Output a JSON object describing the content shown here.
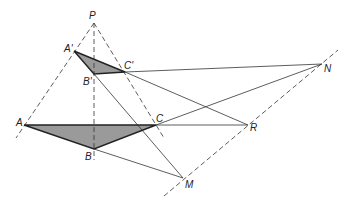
{
  "diagram": {
    "points": {
      "P": {
        "label": "P",
        "x": 94,
        "y": 23
      },
      "A1": {
        "label": "A'",
        "x": 74,
        "y": 51
      },
      "B1": {
        "label": "B'",
        "x": 94,
        "y": 74
      },
      "C1": {
        "label": "C'",
        "x": 125,
        "y": 72
      },
      "A": {
        "label": "A",
        "x": 24,
        "y": 125
      },
      "B": {
        "label": "B",
        "x": 94,
        "y": 149
      },
      "C": {
        "label": "C",
        "x": 156,
        "y": 125
      },
      "M": {
        "label": "M",
        "x": 183,
        "y": 178
      },
      "R": {
        "label": "R",
        "x": 248,
        "y": 125
      },
      "N": {
        "label": "N",
        "x": 322,
        "y": 64
      }
    },
    "triangles": [
      {
        "name": "A'B'C'",
        "vertices": [
          "A1",
          "B1",
          "C1"
        ],
        "fill": "#9a9a9a"
      },
      {
        "name": "ABC",
        "vertices": [
          "A",
          "B",
          "C"
        ],
        "fill": "#9a9a9a"
      }
    ],
    "axis_line": {
      "name": "Desargues axis",
      "through": [
        "M",
        "R",
        "N"
      ],
      "style": "dashed"
    },
    "perspective_lines": [
      {
        "from": "P",
        "through": "A"
      },
      {
        "from": "P",
        "through": "B"
      },
      {
        "from": "P",
        "through": "C"
      }
    ]
  }
}
